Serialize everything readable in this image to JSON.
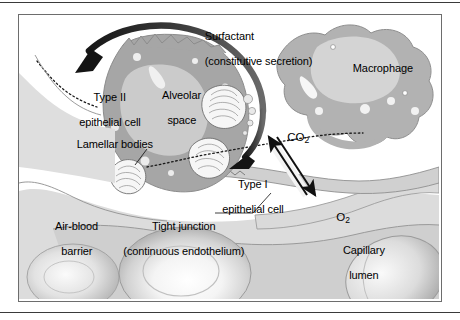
{
  "figure": {
    "frame": {
      "border_color": "#6d6d6d",
      "background": "#ffffff"
    }
  },
  "labels": {
    "surfactant_line1": "Surfactant",
    "surfactant_line2": "(constitutive secretion)",
    "macrophage": "Macrophage",
    "alveolar_space_line1": "Alveolar",
    "alveolar_space_line2": "space",
    "type2_line1": "Type II",
    "type2_line2": "epithelial cell",
    "lamellar_bodies": "Lamellar bodies",
    "type1_line1": "Type I",
    "type1_line2": "epithelial cell",
    "air_blood_line1": "Air-blood",
    "air_blood_line2": "barrier",
    "tight_junction_line1": "Tight junction",
    "tight_junction_line2": "(continuous endothelium)",
    "capillary_line1": "Capillary",
    "capillary_line2": "lumen",
    "co2": "CO",
    "co2_sub": "2",
    "o2": "O",
    "o2_sub": "2"
  },
  "colors": {
    "ink": "#000000",
    "frame": "#6d6d6d",
    "outline": "#8a8a8a",
    "type2_cytoplasm": "#a8a8a8",
    "type2_nucleus": "#c9c9c9",
    "macrophage_cytoplasm": "#b0b0b0",
    "macrophage_nucleus": "#d2d2d2",
    "interstitium": "#d8d8d8",
    "endothelium": "#c4c4c4",
    "rbc_light": "#fdfdfd",
    "rbc_mid": "#d0d0d0",
    "rbc_dark": "#9c9c9c",
    "vesicle": "#ececec",
    "arrow": "#1a1a1a",
    "secretion_arrow": "#4a4a4a"
  },
  "elements": {
    "secretion_arrow_name": "surfactant-secretion-arrow",
    "co2_arrow_name": "co2-diffusion-arrow",
    "o2_arrow_name": "o2-diffusion-arrow",
    "surfactant_layer_name": "surfactant-dashed-layer",
    "lamellar_leader_name": "lamellar-bodies-leader-line",
    "tight_junction_leader_name": "tight-junction-leader-line"
  }
}
